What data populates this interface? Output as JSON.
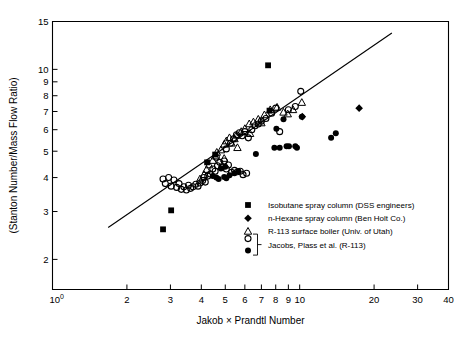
{
  "chart_data": {
    "type": "scatter",
    "title": "",
    "xlabel": "Jakob × Prandtl Number",
    "ylabel": "(Stanton Number/Mass Flow Ratio)",
    "xscale": "log",
    "yscale": "log",
    "xlim": [
      1,
      40
    ],
    "ylim": [
      1.55,
      15
    ],
    "grid": false,
    "legend_position": "lower-right inside axes",
    "xticks": [
      1,
      2,
      3,
      4,
      5,
      6,
      7,
      8,
      9,
      10,
      20,
      30,
      40
    ],
    "xticklabels": [
      "10⁰",
      "2",
      "3",
      "4",
      "5",
      "6",
      "7",
      "8",
      "9",
      "10",
      "20",
      "30",
      "40"
    ],
    "yticks": [
      2,
      3,
      4,
      5,
      6,
      7,
      8,
      9,
      10,
      15
    ],
    "yticklabels": [
      "2",
      "3",
      "4",
      "5",
      "6",
      "7",
      "8",
      "9",
      "10",
      "15"
    ],
    "trendline": {
      "name": "correlation line",
      "x": [
        1.68,
        23.6
      ],
      "y": [
        2.62,
        13.6
      ]
    },
    "series": [
      {
        "name": "Isobutane spray column (DSS engineers)",
        "marker": "filled-square",
        "points": [
          [
            2.8,
            2.58
          ],
          [
            3.02,
            3.03
          ],
          [
            4.22,
            4.55
          ],
          [
            4.55,
            4.86
          ],
          [
            7.45,
            10.35
          ],
          [
            7.55,
            7.05
          ]
        ]
      },
      {
        "name": "n-Hexane spray column (Ben Holt Co.)",
        "marker": "filled-diamond",
        "points": [
          [
            10.25,
            6.7
          ],
          [
            17.4,
            7.2
          ]
        ]
      },
      {
        "name": "R-113 surface boiler (Univ. of Utah)",
        "marker": "open-triangle",
        "points": [
          [
            3.95,
            3.95
          ],
          [
            4.1,
            4.1
          ],
          [
            4.3,
            4.45
          ],
          [
            4.45,
            4.62
          ],
          [
            4.55,
            4.8
          ],
          [
            4.62,
            4.95
          ],
          [
            4.8,
            5.05
          ],
          [
            4.95,
            5.3
          ],
          [
            5.05,
            5.45
          ],
          [
            5.2,
            5.6
          ],
          [
            5.3,
            5.35
          ],
          [
            5.45,
            5.55
          ],
          [
            5.55,
            5.72
          ],
          [
            5.8,
            5.9
          ],
          [
            6.0,
            6.05
          ],
          [
            6.25,
            6.3
          ],
          [
            6.5,
            6.4
          ],
          [
            6.8,
            6.55
          ],
          [
            7.2,
            6.8
          ],
          [
            7.6,
            7.1
          ],
          [
            8.1,
            7.25
          ],
          [
            8.6,
            6.95
          ],
          [
            8.95,
            6.85
          ],
          [
            9.4,
            7.1
          ],
          [
            10.2,
            7.55
          ],
          [
            4.2,
            4.28
          ],
          [
            4.95,
            4.7
          ],
          [
            5.6,
            5.15
          ],
          [
            6.3,
            5.8
          ],
          [
            7.0,
            6.35
          ]
        ]
      },
      {
        "name": "Jacobs, Plass et al. (R-113) — open",
        "marker": "open-circle",
        "points": [
          [
            2.8,
            3.95
          ],
          [
            2.86,
            3.8
          ],
          [
            2.95,
            4.0
          ],
          [
            3.02,
            3.72
          ],
          [
            3.1,
            3.92
          ],
          [
            3.18,
            3.68
          ],
          [
            3.25,
            3.8
          ],
          [
            3.32,
            3.62
          ],
          [
            3.4,
            3.7
          ],
          [
            3.48,
            3.6
          ],
          [
            3.55,
            3.75
          ],
          [
            3.62,
            3.65
          ],
          [
            3.7,
            3.7
          ],
          [
            3.8,
            3.78
          ],
          [
            3.88,
            3.72
          ],
          [
            3.95,
            3.82
          ],
          [
            4.05,
            3.9
          ],
          [
            4.15,
            3.85
          ],
          [
            4.25,
            4.05
          ],
          [
            4.35,
            4.12
          ],
          [
            4.45,
            4.3
          ],
          [
            4.55,
            4.22
          ],
          [
            4.65,
            4.42
          ],
          [
            4.75,
            4.55
          ],
          [
            4.85,
            4.38
          ],
          [
            4.95,
            4.6
          ],
          [
            5.05,
            4.3
          ],
          [
            5.15,
            4.45
          ],
          [
            5.3,
            4.18
          ],
          [
            5.45,
            4.25
          ],
          [
            5.6,
            4.2
          ],
          [
            5.75,
            4.22
          ],
          [
            5.05,
            5.1
          ],
          [
            5.25,
            5.35
          ],
          [
            5.4,
            5.55
          ],
          [
            5.55,
            5.75
          ],
          [
            5.7,
            5.85
          ],
          [
            5.85,
            5.7
          ],
          [
            6.0,
            5.9
          ],
          [
            6.2,
            5.6
          ],
          [
            6.4,
            6.0
          ],
          [
            6.6,
            6.2
          ],
          [
            6.8,
            6.3
          ],
          [
            7.0,
            6.45
          ],
          [
            7.3,
            6.6
          ],
          [
            7.7,
            6.9
          ],
          [
            8.0,
            7.2
          ],
          [
            8.3,
            5.9
          ],
          [
            9.0,
            7.1
          ],
          [
            9.6,
            7.3
          ],
          [
            10.1,
            8.3
          ],
          [
            4.1,
            4.0
          ],
          [
            4.6,
            4.75
          ],
          [
            5.9,
            4.1
          ],
          [
            6.1,
            4.15
          ]
        ]
      },
      {
        "name": "Jacobs, Plass et al. (R-113) — filled",
        "marker": "filled-circle",
        "points": [
          [
            4.45,
            4.05
          ],
          [
            4.6,
            4.0
          ],
          [
            4.7,
            3.95
          ],
          [
            4.95,
            4.02
          ],
          [
            5.05,
            3.98
          ],
          [
            5.2,
            4.08
          ],
          [
            5.45,
            4.15
          ],
          [
            5.65,
            4.22
          ],
          [
            4.8,
            4.32
          ],
          [
            5.0,
            4.38
          ],
          [
            6.65,
            4.88
          ],
          [
            7.9,
            5.15
          ],
          [
            8.3,
            5.15
          ],
          [
            8.85,
            5.22
          ],
          [
            9.05,
            5.22
          ],
          [
            9.6,
            5.22
          ],
          [
            9.75,
            5.15
          ],
          [
            10.2,
            6.7
          ],
          [
            13.4,
            5.6
          ],
          [
            14.0,
            5.82
          ],
          [
            8.05,
            6.05
          ],
          [
            8.6,
            6.55
          ]
        ]
      }
    ]
  },
  "legend": {
    "entries": [
      {
        "marker": "filled-square",
        "label": "Isobutane spray column (DSS engineers)"
      },
      {
        "marker": "filled-diamond",
        "label": "n-Hexane spray column (Ben Holt Co.)"
      },
      {
        "marker": "open-triangle",
        "label": "R-113 surface boiler (Univ. of Utah)"
      },
      {
        "marker": "bracket-circles",
        "label": "Jacobs, Plass  et  al.  (R-113)"
      }
    ]
  },
  "colors": {
    "ink": "#000000",
    "background": "#ffffff"
  }
}
